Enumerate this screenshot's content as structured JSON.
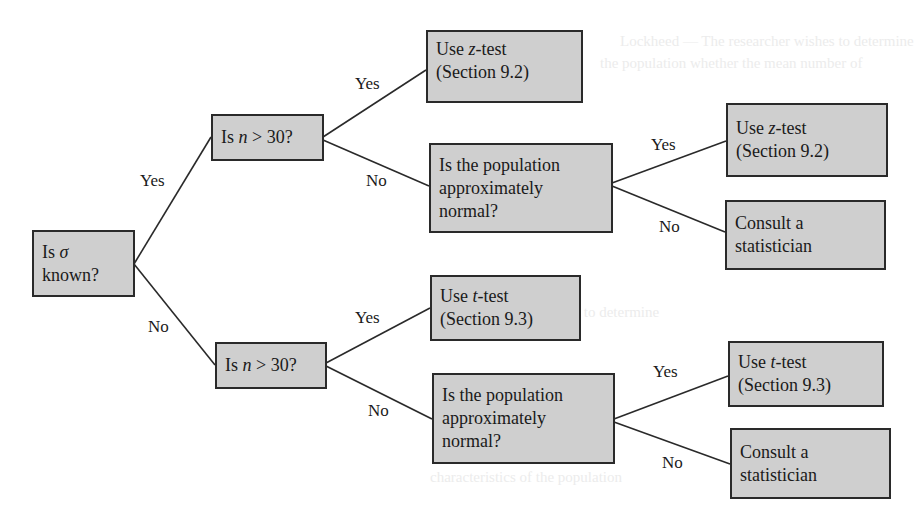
{
  "diagram": {
    "type": "decision-tree",
    "root": {
      "id": "sigma-known",
      "lines": [
        "Is σ",
        "known?"
      ]
    },
    "nodes": [
      {
        "id": "sigma-known",
        "lines": [
          "Is σ",
          "known?"
        ]
      },
      {
        "id": "n-gt-30-top",
        "lines": [
          "Is n > 30?"
        ]
      },
      {
        "id": "n-gt-30-bottom",
        "lines": [
          "Is n > 30?"
        ]
      },
      {
        "id": "z-test-1",
        "lines": [
          "Use z-test",
          "(Section 9.2)"
        ]
      },
      {
        "id": "pop-normal-top",
        "lines": [
          "Is the population",
          "approximately",
          "normal?"
        ]
      },
      {
        "id": "t-test-1",
        "lines": [
          "Use t-test",
          "(Section 9.3)"
        ]
      },
      {
        "id": "pop-normal-bottom",
        "lines": [
          "Is the population",
          "approximately",
          "normal?"
        ]
      },
      {
        "id": "z-test-2",
        "lines": [
          "Use z-test",
          "(Section 9.2)"
        ]
      },
      {
        "id": "consult-top",
        "lines": [
          "Consult a",
          "statistician"
        ]
      },
      {
        "id": "t-test-2",
        "lines": [
          "Use t-test",
          "(Section 9.3)"
        ]
      },
      {
        "id": "consult-bottom",
        "lines": [
          "Consult a",
          "statistician"
        ]
      }
    ],
    "edges": [
      {
        "from": "sigma-known",
        "to": "n-gt-30-top",
        "label": "Yes"
      },
      {
        "from": "sigma-known",
        "to": "n-gt-30-bottom",
        "label": "No"
      },
      {
        "from": "n-gt-30-top",
        "to": "z-test-1",
        "label": "Yes"
      },
      {
        "from": "n-gt-30-top",
        "to": "pop-normal-top",
        "label": "No"
      },
      {
        "from": "pop-normal-top",
        "to": "z-test-2",
        "label": "Yes"
      },
      {
        "from": "pop-normal-top",
        "to": "consult-top",
        "label": "No"
      },
      {
        "from": "n-gt-30-bottom",
        "to": "t-test-1",
        "label": "Yes"
      },
      {
        "from": "n-gt-30-bottom",
        "to": "pop-normal-bottom",
        "label": "No"
      },
      {
        "from": "pop-normal-bottom",
        "to": "t-test-2",
        "label": "Yes"
      },
      {
        "from": "pop-normal-bottom",
        "to": "consult-bottom",
        "label": "No"
      }
    ]
  },
  "labels": {
    "sigma_known": {
      "prefix": "Is ",
      "symbol": "σ",
      "line2": "known?"
    },
    "n_gt_30": {
      "prefix": "Is ",
      "var": "n",
      "suffix": " > 30?"
    },
    "z_test": {
      "prefix": "Use ",
      "var": "z",
      "suffix": "-test",
      "section": "(Section 9.2)"
    },
    "t_test": {
      "prefix": "Use ",
      "var": "t",
      "suffix": "-test",
      "section": "(Section 9.3)"
    },
    "pop_normal": {
      "line1": "Is the population",
      "line2": "approximately",
      "line3": "normal?"
    },
    "consult": {
      "line1": "Consult a",
      "line2": "statistician"
    },
    "yes": "Yes",
    "no": "No"
  },
  "colors": {
    "box_fill": "#cfcfcf",
    "box_border": "#2a2a2a",
    "line": "#2a2a2a",
    "background": "#ffffff"
  }
}
